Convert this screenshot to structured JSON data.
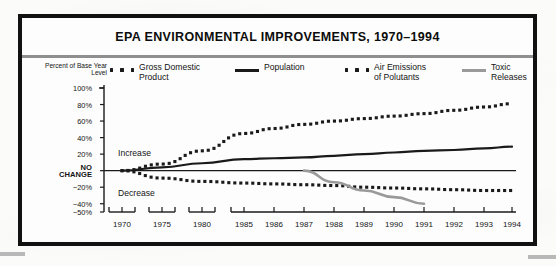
{
  "figure": {
    "title": "EPA ENVIRONMENTAL IMPROVEMENTS, 1970–1994",
    "axis_caption": "Percent of\nBase Year Level",
    "increase_label": "Increase",
    "decrease_label": "Decrease"
  },
  "colors": {
    "frame": "#111111",
    "rule": "#8f8f8f",
    "ink": "#1a1a1a",
    "toxic": "#9a9a9a",
    "paper": "#fdfdfd"
  },
  "legend": {
    "position": "top",
    "items": [
      {
        "label": "Gross Domestic\nProduct",
        "style": "dotted",
        "color": "#1a1a1a",
        "name": "gross-domestic-product"
      },
      {
        "label": "Population",
        "style": "solid",
        "color": "#1a1a1a",
        "name": "population"
      },
      {
        "label": "Air Emissions\nof Polutants",
        "style": "dotted",
        "color": "#1a1a1a",
        "name": "air-emissions-of-polutants"
      },
      {
        "label": "Toxic Releases",
        "style": "solid",
        "color": "#9a9a9a",
        "name": "toxic-releases"
      }
    ]
  },
  "chart_data": {
    "type": "line",
    "title": "EPA ENVIRONMENTAL IMPROVEMENTS, 1970–1994",
    "xlabel": "",
    "ylabel": "Percent of Base Year Level",
    "ylim": [
      -50,
      100
    ],
    "grid": false,
    "legend_position": "top",
    "y_ticks": [
      100,
      80,
      60,
      40,
      20,
      0,
      -20,
      -40,
      -50
    ],
    "y_tick_labels": [
      "100%",
      "80%",
      "60%",
      "40%",
      "20%",
      "NO CHANGE",
      "−20%",
      "−40%",
      "−50%"
    ],
    "x_ticks": [
      1970,
      1975,
      1980,
      1985,
      1986,
      1987,
      1988,
      1989,
      1990,
      1991,
      1992,
      1993,
      1994
    ],
    "x_tick_labels": [
      "1970",
      "1975",
      "1980",
      "1985",
      "1986",
      "1987",
      "1988",
      "1989",
      "1990",
      "1991",
      "1992",
      "1993",
      "1994"
    ],
    "axis_breaks": true,
    "annotations": [
      "Increase",
      "Decrease"
    ],
    "series": [
      {
        "name": "Gross Domestic Product",
        "style": "dotted",
        "color": "#1a1a1a",
        "x": [
          1970,
          1975,
          1980,
          1985,
          1986,
          1987,
          1988,
          1989,
          1990,
          1991,
          1992,
          1993,
          1994
        ],
        "values": [
          0,
          8,
          24,
          45,
          51,
          56,
          60,
          63,
          66,
          69,
          73,
          77,
          81
        ]
      },
      {
        "name": "Population",
        "style": "solid",
        "color": "#1a1a1a",
        "x": [
          1970,
          1975,
          1980,
          1985,
          1986,
          1987,
          1988,
          1989,
          1990,
          1991,
          1992,
          1993,
          1994
        ],
        "values": [
          0,
          4,
          9,
          14,
          15,
          16,
          18,
          20,
          22,
          24,
          25,
          27,
          29
        ]
      },
      {
        "name": "Air Emissions of Polutants",
        "style": "dotted",
        "color": "#1a1a1a",
        "x": [
          1970,
          1975,
          1980,
          1985,
          1986,
          1987,
          1988,
          1989,
          1990,
          1991,
          1992,
          1993,
          1994
        ],
        "values": [
          0,
          -9,
          -13,
          -15,
          -16,
          -17,
          -18,
          -20,
          -21,
          -22,
          -23,
          -24,
          -24
        ]
      },
      {
        "name": "Toxic Releases",
        "style": "solid",
        "color": "#9a9a9a",
        "x": [
          1987,
          1988,
          1989,
          1990,
          1991
        ],
        "values": [
          0,
          -14,
          -24,
          -32,
          -40
        ]
      }
    ]
  }
}
